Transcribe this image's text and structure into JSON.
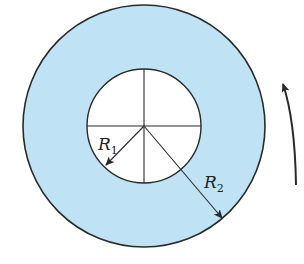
{
  "diagram": {
    "colors": {
      "annulus_fill": "#bfe3f4",
      "inner_fill": "#ffffff",
      "stroke": "#2a2a2a"
    },
    "labels": {
      "r1_main": "R",
      "r1_sub": "1",
      "r2_main": "R",
      "r2_sub": "2"
    },
    "rotation_direction": "counterclockwise"
  }
}
